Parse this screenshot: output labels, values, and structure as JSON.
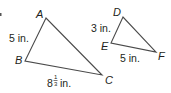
{
  "colors": {
    "background": "#ffffff",
    "line": "#4a4a4a",
    "text": "#231f20"
  },
  "triangles": [
    {
      "name": "ABC",
      "vertices": {
        "A": {
          "label": "A",
          "x": 46,
          "y": 18
        },
        "B": {
          "label": "B",
          "x": 25,
          "y": 61
        },
        "C": {
          "label": "C",
          "x": 102,
          "y": 75
        }
      },
      "sides": {
        "AB": {
          "label": "5 in."
        },
        "BC": {
          "whole": "8",
          "numerator": "1",
          "denominator": "3",
          "unit": "in."
        }
      }
    },
    {
      "name": "DEF",
      "vertices": {
        "D": {
          "label": "D",
          "x": 123,
          "y": 17
        },
        "E": {
          "label": "E",
          "x": 111,
          "y": 43
        },
        "F": {
          "label": "F",
          "x": 156,
          "y": 52
        }
      },
      "sides": {
        "DE": {
          "label": "3 in."
        },
        "EF": {
          "label": "5 in."
        }
      }
    }
  ]
}
